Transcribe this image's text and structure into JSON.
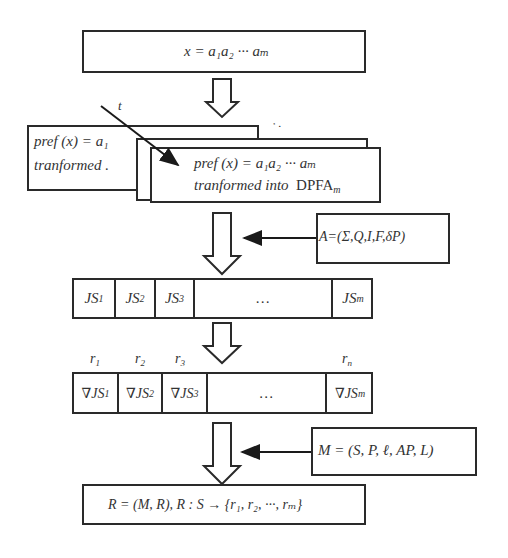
{
  "input_box": {
    "formula": "x = a₁a₂ ··· aₘ"
  },
  "prefix_boxes": {
    "back": {
      "line1": "pref (x) = a₁",
      "line2": "tranformed ."
    },
    "front": {
      "line1": "pref (x) = a₁a₂ ··· aₘ",
      "line2_italic": "tranformed  into",
      "line2_upright": "DPFA",
      "line2_sub": "m"
    },
    "ellipsis_diag": "· ·",
    "t_label": "t"
  },
  "automaton_box": {
    "formula": "A=(Σ,Q,I,F,δP)"
  },
  "js_row": {
    "cells": [
      {
        "base": "JS",
        "sub": "1"
      },
      {
        "base": "JS",
        "sub": "2"
      },
      {
        "base": "JS",
        "sub": "3"
      },
      {
        "base": "…",
        "sub": ""
      },
      {
        "base": "JS",
        "sub": "m"
      }
    ]
  },
  "grad_row": {
    "labels": [
      {
        "base": "r",
        "sub": "1"
      },
      {
        "base": "r",
        "sub": "2"
      },
      {
        "base": "r",
        "sub": "3"
      },
      {
        "base": "r",
        "sub": "n"
      }
    ],
    "cells": [
      {
        "base": "∇JS",
        "sub": "1"
      },
      {
        "base": "∇JS",
        "sub": "2"
      },
      {
        "base": "∇JS",
        "sub": "3"
      },
      {
        "base": "…",
        "sub": ""
      },
      {
        "base": "∇JS",
        "sub": "m"
      }
    ]
  },
  "model_box": {
    "formula": "M = (S, P, ℓ, AP, L)"
  },
  "result_box": {
    "formula": "R = (M, R),  R : S → {r₁, r₂, ···, rₘ}"
  },
  "colors": {
    "stroke": "#2a2a2a",
    "text": "#333333",
    "background": "#ffffff"
  }
}
